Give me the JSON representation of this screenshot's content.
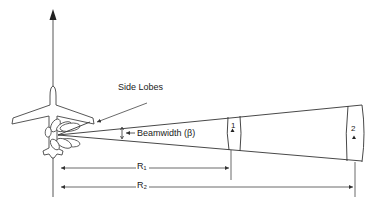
{
  "diagram": {
    "labels": {
      "side_lobes": "Side Lobes",
      "beamwidth": "Beamwidth (β)",
      "cell_1": "1",
      "cell_2": "2",
      "range_1": "R₁",
      "range_2": "R₂"
    },
    "elements": [
      "aircraft-top-view",
      "heading-arrow",
      "radar-main-beam",
      "side-lobes",
      "resolution-cell-1",
      "resolution-cell-2",
      "range-arrow-r1",
      "range-arrow-r2"
    ],
    "colors": {
      "line": "#333333",
      "background": "#ffffff"
    }
  }
}
